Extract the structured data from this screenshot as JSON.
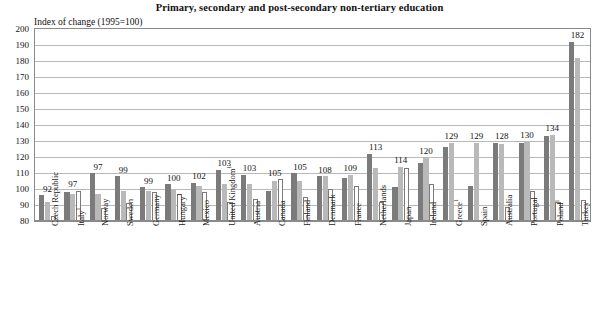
{
  "chart_data": {
    "type": "bar",
    "title": "Primary, secondary and post-secondary non-tertiary education",
    "subtitle": "",
    "ylabel": "Index of change (1995=100)",
    "xlabel": "",
    "ylim": [
      80,
      200
    ],
    "ytick_step": 10,
    "yticks": [
      200,
      190,
      180,
      170,
      160,
      150,
      140,
      130,
      120,
      110,
      100,
      90,
      80
    ],
    "grid": true,
    "legend": "none",
    "baseline": 100,
    "categories": [
      "Czech Republic",
      "Italy",
      "Norway",
      "Sweden",
      "Germany",
      "Hungary",
      "Mexico",
      "United Kingdom",
      "Austria",
      "Canada",
      "Finland",
      "Denmark",
      "France",
      "Netherlands",
      "Japan",
      "Ireland",
      "Greece",
      "Spain",
      "Australia",
      "Portugal",
      "Poland",
      "Turkey"
    ],
    "category_footnotes": {
      "Italy": "1",
      "Hungary": "1",
      "United Kingdom": "1",
      "Greece": "1",
      "Poland": "1"
    },
    "data_labels": [
      92,
      97,
      97,
      99,
      99,
      100,
      102,
      103,
      103,
      105,
      105,
      108,
      109,
      113,
      114,
      120,
      129,
      129,
      128,
      130,
      134,
      182
    ],
    "series": [
      {
        "name": "series-1",
        "color": "#7b7b7b",
        "values": [
          96,
          98,
          110,
          108,
          101,
          103,
          104,
          112,
          109,
          99,
          110,
          108,
          107,
          122,
          101,
          116,
          126,
          102,
          129,
          129,
          133,
          192
        ]
      },
      {
        "name": "series-2",
        "color": "#b9b9b9",
        "values": [
          92,
          97,
          97,
          99,
          99,
          100,
          102,
          103,
          103,
          105,
          105,
          108,
          109,
          113,
          114,
          120,
          129,
          129,
          128,
          130,
          134,
          182
        ]
      },
      {
        "name": "series-3",
        "color": "#ffffff",
        "values": [
          83,
          99,
          88,
          91,
          98,
          97,
          98,
          92,
          94,
          106,
          95,
          100,
          102,
          92,
          113,
          103,
          79,
          72,
          89,
          99,
          92,
          93
        ]
      }
    ]
  }
}
